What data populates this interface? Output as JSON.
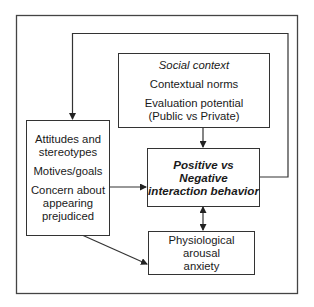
{
  "diagram": {
    "type": "flow-model",
    "nodes": {
      "social_context": {
        "heading": "Social context",
        "items": [
          "Contextual norms",
          "Evaluation potential",
          "(Public vs Private)"
        ]
      },
      "individual_factors": {
        "items": [
          "Attitudes and",
          "stereotypes",
          "Motives/goals",
          "Concern about",
          "appearing",
          "prejudiced"
        ]
      },
      "behavior": {
        "lines": [
          "Positive vs Negative",
          "interaction behavior"
        ]
      },
      "arousal": {
        "lines": [
          "Physiological arousal",
          "anxiety"
        ]
      }
    },
    "edges": [
      {
        "from": "social_context",
        "to": "behavior",
        "type": "arrow"
      },
      {
        "from": "individual_factors",
        "to": "behavior",
        "type": "arrow"
      },
      {
        "from": "individual_factors",
        "to": "arousal",
        "type": "arrow"
      },
      {
        "from": "behavior",
        "to": "arousal",
        "type": "bidirectional"
      },
      {
        "from": "behavior",
        "to": "individual_factors",
        "type": "feedback-arrow"
      }
    ],
    "colors": {
      "line": "#333333",
      "background": "#ffffff",
      "text": "#1a1a1a"
    }
  }
}
